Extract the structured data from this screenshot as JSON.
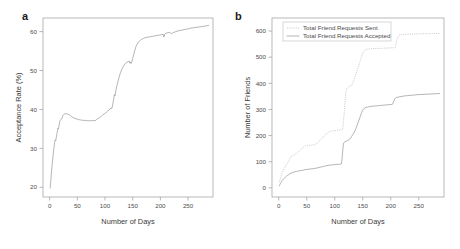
{
  "figure": {
    "width": 460,
    "height": 249,
    "background": "#ffffff",
    "panel_a_letter": "a",
    "panel_b_letter": "b"
  },
  "chart_data": [
    {
      "id": "panel-a",
      "type": "line",
      "title": "",
      "panel_label": "a",
      "xlabel": "Number of Days",
      "ylabel": "Acceptance Rate (%)",
      "xlim": [
        -12,
        295
      ],
      "ylim": [
        17.5,
        63.5
      ],
      "xticks": [
        0,
        50,
        100,
        150,
        200,
        250
      ],
      "xticklabels": [
        "0",
        "50",
        "100",
        "150",
        "200",
        "250"
      ],
      "yticks": [
        20,
        30,
        40,
        50,
        60
      ],
      "yticklabels": [
        "20",
        "30",
        "40",
        "50",
        "60"
      ],
      "grid": false,
      "legend": null,
      "series": [
        {
          "name": "Acceptance Rate",
          "style": "solid",
          "color": "#8c8c8c",
          "x": [
            1,
            2,
            3,
            4,
            5,
            6,
            7,
            8,
            9,
            10,
            11,
            12,
            13,
            14,
            15,
            16,
            17,
            18,
            19,
            20,
            22,
            24,
            26,
            28,
            30,
            33,
            36,
            40,
            44,
            48,
            52,
            56,
            60,
            64,
            68,
            72,
            76,
            80,
            82,
            84,
            86,
            88,
            90,
            93,
            96,
            99,
            102,
            105,
            107,
            109,
            111,
            112,
            113,
            114,
            115,
            116,
            117,
            118,
            119,
            120,
            122,
            124,
            126,
            128,
            130,
            132,
            134,
            136,
            138,
            140,
            142,
            144,
            145,
            146,
            147,
            148,
            149,
            150,
            152,
            154,
            156,
            158,
            160,
            163,
            166,
            170,
            174,
            178,
            182,
            186,
            190,
            194,
            198,
            202,
            205,
            206,
            207,
            208,
            210,
            213,
            216,
            220,
            224,
            228,
            232,
            236,
            240,
            245,
            250,
            255,
            260,
            265,
            270,
            275,
            280,
            284,
            287
          ],
          "y": [
            19.8,
            21.5,
            23.4,
            25.0,
            26.6,
            27.9,
            29.2,
            30.4,
            31.4,
            32.2,
            32.0,
            32.8,
            33.6,
            34.4,
            35.2,
            35.0,
            35.9,
            36.7,
            37.2,
            37.4,
            37.6,
            38.5,
            38.8,
            38.9,
            38.9,
            38.8,
            38.6,
            38.1,
            37.8,
            37.6,
            37.4,
            37.3,
            37.2,
            37.2,
            37.1,
            37.1,
            37.1,
            37.2,
            37.1,
            37.3,
            37.6,
            37.7,
            37.9,
            38.2,
            38.6,
            38.9,
            39.2,
            39.6,
            39.9,
            40.1,
            40.4,
            40.2,
            40.6,
            41.3,
            42.2,
            43.0,
            43.8,
            43.5,
            44.3,
            45.2,
            46.4,
            47.5,
            48.6,
            49.5,
            50.2,
            50.8,
            51.3,
            51.7,
            52.0,
            52.2,
            52.3,
            52.4,
            51.9,
            52.2,
            51.8,
            52.1,
            52.5,
            53.1,
            54.2,
            55.3,
            56.2,
            56.8,
            57.3,
            57.7,
            58.0,
            58.3,
            58.5,
            58.6,
            58.7,
            58.8,
            58.9,
            59.0,
            59.1,
            59.2,
            59.3,
            58.6,
            58.8,
            59.4,
            59.6,
            59.7,
            59.8,
            59.5,
            59.8,
            60.0,
            60.2,
            60.3,
            60.4,
            60.6,
            60.7,
            60.9,
            61.0,
            61.1,
            61.2,
            61.3,
            61.4,
            61.5,
            61.6
          ]
        }
      ]
    },
    {
      "id": "panel-b",
      "type": "line",
      "title": "",
      "panel_label": "b",
      "xlabel": "Number of Days",
      "ylabel": "Number of Friends",
      "xlim": [
        -12,
        295
      ],
      "ylim": [
        -35,
        650
      ],
      "xticks": [
        0,
        50,
        100,
        150,
        200,
        250
      ],
      "xticklabels": [
        "0",
        "50",
        "100",
        "150",
        "200",
        "250"
      ],
      "yticks": [
        0,
        100,
        200,
        300,
        400,
        500,
        600
      ],
      "yticklabels": [
        "0",
        "100",
        "200",
        "300",
        "400",
        "500",
        "600"
      ],
      "grid": false,
      "legend": {
        "position": "top-left",
        "entries": [
          {
            "label": "Total Friend Requests Sent",
            "style": "dotted",
            "color": "#b0b0b0"
          },
          {
            "label": "Total Friend Requests Accepted",
            "style": "solid",
            "color": "#8c8c8c"
          }
        ]
      },
      "series": [
        {
          "name": "Total Friend Requests Sent",
          "style": "dotted",
          "color": "#b0b0b0",
          "x": [
            1,
            2,
            3,
            4,
            5,
            6,
            8,
            10,
            12,
            14,
            16,
            18,
            20,
            22,
            24,
            26,
            28,
            32,
            36,
            40,
            44,
            48,
            52,
            56,
            60,
            64,
            68,
            72,
            76,
            80,
            84,
            88,
            92,
            96,
            100,
            104,
            108,
            110,
            112,
            114,
            115,
            116,
            117,
            118,
            119,
            120,
            122,
            124,
            126,
            128,
            130,
            132,
            134,
            136,
            138,
            140,
            142,
            144,
            146,
            148,
            150,
            152,
            154,
            156,
            158,
            160,
            165,
            170,
            175,
            180,
            185,
            190,
            195,
            200,
            205,
            208,
            210,
            212,
            214,
            216,
            218,
            220,
            225,
            230,
            240,
            250,
            260,
            270,
            280,
            287
          ],
          "y": [
            20,
            28,
            36,
            44,
            52,
            58,
            66,
            74,
            82,
            90,
            96,
            104,
            112,
            120,
            122,
            124,
            126,
            132,
            140,
            148,
            155,
            160,
            162,
            163,
            164,
            165,
            170,
            178,
            186,
            196,
            205,
            212,
            216,
            218,
            219,
            220,
            221,
            222,
            222,
            223,
            240,
            265,
            290,
            318,
            345,
            370,
            382,
            386,
            388,
            390,
            392,
            400,
            412,
            425,
            438,
            450,
            462,
            476,
            490,
            505,
            515,
            522,
            527,
            530,
            531,
            532,
            532,
            533,
            533,
            534,
            534,
            535,
            535,
            536,
            536,
            537,
            560,
            575,
            582,
            585,
            586,
            587,
            588,
            588,
            589,
            589,
            590,
            590,
            591,
            591
          ]
        },
        {
          "name": "Total Friend Requests Accepted",
          "style": "solid",
          "color": "#8c8c8c",
          "x": [
            1,
            2,
            3,
            4,
            5,
            6,
            8,
            10,
            12,
            14,
            16,
            18,
            20,
            24,
            28,
            32,
            36,
            40,
            44,
            48,
            52,
            56,
            60,
            64,
            68,
            72,
            76,
            80,
            84,
            88,
            92,
            96,
            100,
            104,
            108,
            110,
            112,
            113,
            114,
            115,
            116,
            118,
            120,
            122,
            124,
            126,
            128,
            130,
            132,
            134,
            136,
            138,
            140,
            142,
            144,
            146,
            148,
            150,
            152,
            154,
            156,
            158,
            160,
            163,
            166,
            170,
            175,
            180,
            185,
            190,
            195,
            200,
            203,
            205,
            207,
            209,
            212,
            215,
            220,
            225,
            230,
            235,
            240,
            250,
            260,
            270,
            280,
            287
          ],
          "y": [
            8,
            12,
            16,
            20,
            24,
            28,
            33,
            37,
            41,
            45,
            48,
            51,
            54,
            58,
            61,
            63,
            65,
            66,
            68,
            70,
            71,
            72,
            73,
            74,
            76,
            78,
            80,
            82,
            84,
            86,
            87,
            88,
            89,
            90,
            90,
            91,
            92,
            110,
            135,
            160,
            172,
            176,
            178,
            180,
            182,
            185,
            190,
            196,
            203,
            210,
            218,
            228,
            240,
            252,
            264,
            276,
            288,
            297,
            303,
            306,
            308,
            309,
            310,
            311,
            312,
            313,
            314,
            315,
            316,
            317,
            318,
            319,
            320,
            330,
            340,
            345,
            347,
            348,
            350,
            352,
            353,
            354,
            355,
            357,
            358,
            359,
            360,
            361
          ]
        }
      ]
    }
  ]
}
